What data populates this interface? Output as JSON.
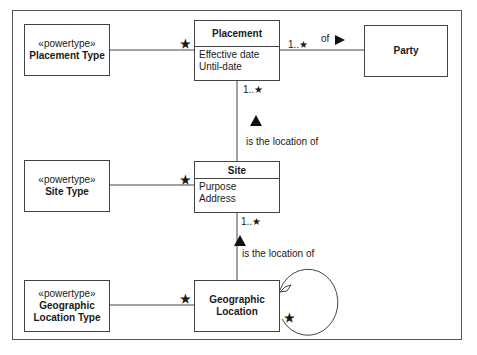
{
  "diagram": {
    "type": "UML class diagram",
    "classes": {
      "placement_type": {
        "stereotype": "«powertype»",
        "name": "Placement Type"
      },
      "placement": {
        "name": "Placement",
        "attributes": [
          "Effective date",
          "Until-date"
        ]
      },
      "party": {
        "name": "Party"
      },
      "site_type": {
        "stereotype": "«powertype»",
        "name": "Site Type"
      },
      "site": {
        "name": "Site",
        "attributes": [
          "Purpose",
          "Address"
        ]
      },
      "geo_type": {
        "stereotype": "«powertype»",
        "name_line1": "Geographic",
        "name_line2": "Location Type"
      },
      "geo_location": {
        "name_line1": "Geographic",
        "name_line2": "Location"
      }
    },
    "associations": {
      "placement_party": {
        "label": "of",
        "direction": "right",
        "multiplicity": "1..★"
      },
      "placement_type_mult": "★",
      "site_placement": {
        "label": "is the location of",
        "direction": "up",
        "multiplicity": "1..★"
      },
      "site_type_mult": "★",
      "geo_site": {
        "label": "is the location of",
        "direction": "up",
        "multiplicity": "1..★"
      },
      "geo_type_mult": "★",
      "geo_self_mult": "★"
    }
  }
}
